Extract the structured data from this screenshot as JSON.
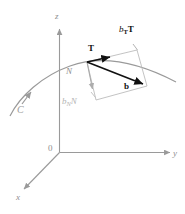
{
  "figure": {
    "axes": {
      "z_label": "z",
      "y_label": "y",
      "x_label": "x",
      "origin_label": "0"
    },
    "curve": {
      "label": "C",
      "direction_arrow": "arrow-up-right"
    },
    "vectors": {
      "tangent_label": "T",
      "normal_label": "N",
      "resultant_label": "b",
      "tangential_component": {
        "base": "b",
        "subscript": "T",
        "unit": "T",
        "full": "bTT"
      },
      "normal_component": {
        "base": "b",
        "subscript": "N",
        "unit": "N",
        "full": "bNN"
      }
    },
    "colors": {
      "axis": "#9a9a9a",
      "curve": "#9a9a9a",
      "parallelogram": "#b9b9b9",
      "bold_vector": "#111111",
      "normal_gray": "#a8a8a8",
      "background": "#ffffff"
    }
  }
}
